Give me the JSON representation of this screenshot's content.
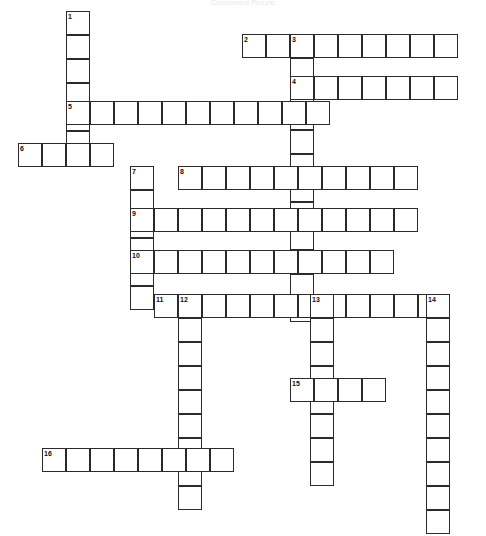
{
  "page": {
    "title": "Crossword Puzzle",
    "type": "crossword-grid",
    "width": 486,
    "height": 536,
    "cell_size": 24,
    "grid_origin_x": 18,
    "grid_origin_y": 11,
    "colors": {
      "cell_border": "#2b2b2b",
      "cell_fill": "#ffffff",
      "background": "#ffffff",
      "number_text": "#111111"
    }
  },
  "entries": [
    {
      "number": "1",
      "direction": "down",
      "x": 66,
      "y": 11,
      "length": 6,
      "label": "1"
    },
    {
      "number": "2",
      "direction": "across",
      "x": 242,
      "y": 34,
      "length": 9,
      "label": "2"
    },
    {
      "number": "3",
      "direction": "down",
      "x": 290,
      "y": 34,
      "length": 12,
      "label": "3"
    },
    {
      "number": "4",
      "direction": "across",
      "x": 290,
      "y": 76,
      "length": 7,
      "label": "4"
    },
    {
      "number": "5",
      "direction": "across",
      "x": 66,
      "y": 101,
      "length": 11,
      "label": "5"
    },
    {
      "number": "6",
      "direction": "across",
      "x": 18,
      "y": 143,
      "length": 4,
      "label": "6"
    },
    {
      "number": "7",
      "direction": "down",
      "x": 130,
      "y": 166,
      "length": 6,
      "label": "7"
    },
    {
      "number": "8",
      "direction": "across",
      "x": 178,
      "y": 166,
      "length": 10,
      "label": "8"
    },
    {
      "number": "9",
      "direction": "across",
      "x": 130,
      "y": 208,
      "length": 12,
      "label": "9"
    },
    {
      "number": "10",
      "direction": "across",
      "x": 130,
      "y": 250,
      "length": 11,
      "label": "10"
    },
    {
      "number": "11",
      "direction": "across",
      "x": 154,
      "y": 294,
      "length": 12,
      "label": "11"
    },
    {
      "number": "12",
      "direction": "down",
      "x": 178,
      "y": 294,
      "length": 9,
      "label": "12"
    },
    {
      "number": "13",
      "direction": "down",
      "x": 310,
      "y": 294,
      "length": 8,
      "label": "13"
    },
    {
      "number": "14",
      "direction": "down",
      "x": 426,
      "y": 294,
      "length": 10,
      "label": "14"
    },
    {
      "number": "15",
      "direction": "across",
      "x": 290,
      "y": 378,
      "length": 4,
      "label": "15"
    },
    {
      "number": "16",
      "direction": "across",
      "x": 42,
      "y": 448,
      "length": 8,
      "label": "16"
    }
  ]
}
